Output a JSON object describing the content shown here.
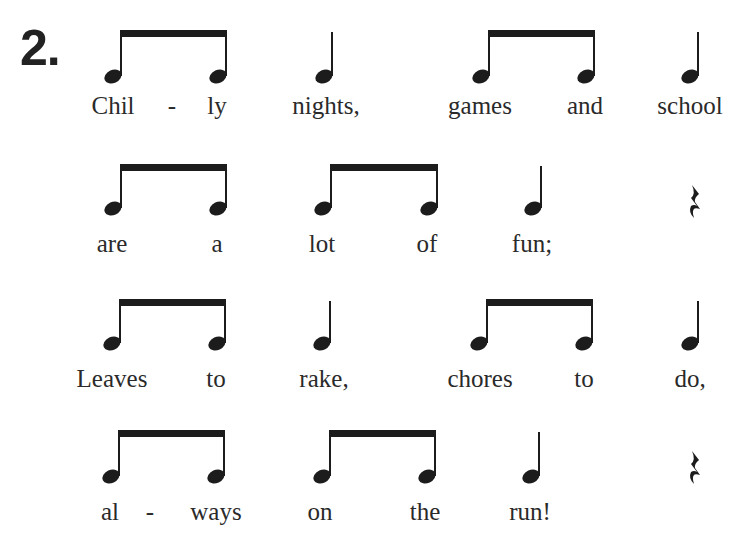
{
  "exercise": {
    "number": "2."
  },
  "lines": [
    {
      "top": 20,
      "stem_top": 10,
      "head_y": 52,
      "word_y": 72,
      "notes": [
        {
          "type": "eighth-pair",
          "x1": 120,
          "x2": 225
        },
        {
          "type": "quarter",
          "x": 331
        },
        {
          "type": "eighth-pair",
          "x1": 488,
          "x2": 593
        },
        {
          "type": "quarter",
          "x": 697
        }
      ],
      "words": [
        {
          "text": "Chil",
          "x": 113
        },
        {
          "text": "-",
          "x": 172
        },
        {
          "text": "ly",
          "x": 217
        },
        {
          "text": "nights,",
          "x": 326
        },
        {
          "text": "games",
          "x": 480
        },
        {
          "text": "and",
          "x": 585
        },
        {
          "text": "school",
          "x": 690
        }
      ]
    },
    {
      "top": 150,
      "stem_top": 14,
      "head_y": 54,
      "word_y": 80,
      "notes": [
        {
          "type": "eighth-pair",
          "x1": 120,
          "x2": 225
        },
        {
          "type": "eighth-pair",
          "x1": 330,
          "x2": 436
        },
        {
          "type": "quarter",
          "x": 540
        },
        {
          "type": "rest",
          "x": 686
        }
      ],
      "words": [
        {
          "text": "are",
          "x": 112
        },
        {
          "text": "a",
          "x": 217
        },
        {
          "text": "lot",
          "x": 322
        },
        {
          "text": "of",
          "x": 427
        },
        {
          "text": "fun;",
          "x": 532
        }
      ]
    },
    {
      "top": 285,
      "stem_top": 14,
      "head_y": 54,
      "word_y": 80,
      "notes": [
        {
          "type": "eighth-pair",
          "x1": 119,
          "x2": 224
        },
        {
          "type": "quarter",
          "x": 329
        },
        {
          "type": "eighth-pair",
          "x1": 486,
          "x2": 591
        },
        {
          "type": "quarter",
          "x": 697
        }
      ],
      "words": [
        {
          "text": "Leaves",
          "x": 112
        },
        {
          "text": "to",
          "x": 216
        },
        {
          "text": "rake,",
          "x": 324
        },
        {
          "text": "chores",
          "x": 480
        },
        {
          "text": "to",
          "x": 584
        },
        {
          "text": "do,",
          "x": 690
        }
      ]
    },
    {
      "top": 420,
      "stem_top": 10,
      "head_y": 52,
      "word_y": 78,
      "notes": [
        {
          "type": "eighth-pair",
          "x1": 118,
          "x2": 223
        },
        {
          "type": "eighth-pair",
          "x1": 329,
          "x2": 434
        },
        {
          "type": "quarter",
          "x": 538
        },
        {
          "type": "rest",
          "x": 686
        }
      ],
      "words": [
        {
          "text": "al",
          "x": 110
        },
        {
          "text": "-",
          "x": 150
        },
        {
          "text": "ways",
          "x": 216
        },
        {
          "text": "on",
          "x": 320
        },
        {
          "text": "the",
          "x": 425
        },
        {
          "text": "run!",
          "x": 530
        }
      ]
    }
  ],
  "colors": {
    "ink": "#1c1c1c",
    "text": "#2a2a2a",
    "background": "#ffffff"
  }
}
